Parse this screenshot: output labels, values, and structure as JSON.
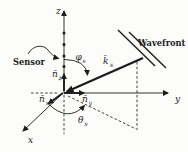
{
  "colors": {
    "background": "#fcfcfa",
    "ink": "#1c1c1c"
  },
  "labels": {
    "z_axis": "z",
    "y_axis": "y",
    "x_axis": "x",
    "sensor": "Sensor",
    "wavefront": "Wavefront",
    "k_vector": {
      "base": "k̄",
      "sub": "s"
    },
    "phi_angle": {
      "base": "φ",
      "sub": "s"
    },
    "theta_angle": {
      "base": "θ",
      "sub": "s"
    },
    "unit_vector_x": {
      "base": "n̄",
      "sub": "x"
    },
    "unit_vector_y": {
      "base": "n̄",
      "sub": "y"
    },
    "unit_vector_z": {
      "base": "n̄",
      "sub": "z"
    }
  }
}
